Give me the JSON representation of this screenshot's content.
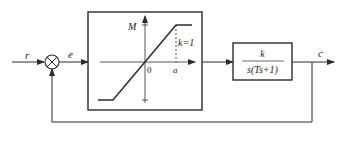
{
  "diagram": {
    "type": "closed-loop control block diagram",
    "signals": {
      "input": "r",
      "error": "e",
      "output": "c"
    },
    "summing_junction": {
      "symbol": "⊗"
    },
    "nonlinear_block": {
      "description": "saturation nonlinearity",
      "y_axis_label": "M",
      "x_mark_label": "a",
      "origin_label": "0",
      "slope_label": "k=1"
    },
    "linear_block": {
      "numerator": "k",
      "denominator": "s(Ts+1)"
    },
    "feedback": "unity negative feedback"
  },
  "colors": {
    "line": "#2b2b2b",
    "background": "#ffffff"
  }
}
